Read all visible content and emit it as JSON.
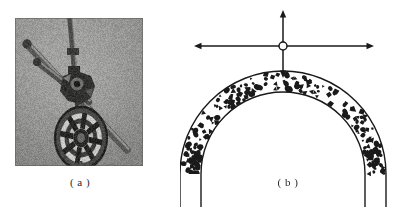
{
  "figure": {
    "background_color": "#ffffff",
    "ink_color": "#1a1a1a",
    "width": 418,
    "height": 211,
    "panels": [
      {
        "id": "a",
        "caption": "( a )",
        "type": "photograph",
        "subject": "mechanical drilling rig head assembly",
        "photo": {
          "frame": {
            "x": 15,
            "y": 18,
            "width": 128,
            "height": 148
          },
          "background_gray": "#a9a9a7",
          "vignette_gray": "#8f8f8d",
          "parts": [
            {
              "name": "vertical-drill-shaft",
              "shade": "#4a4a48"
            },
            {
              "name": "upper-diagonal-rod",
              "shade": "#565654"
            },
            {
              "name": "lower-diagonal-rod",
              "shade": "#5e5e5c"
            },
            {
              "name": "central-hub-joint",
              "shade": "#2e2e2c"
            },
            {
              "name": "rosette-cutter-head",
              "shade": "#3a3a38"
            },
            {
              "name": "cutter-hub-core",
              "shade": "#262624"
            }
          ]
        }
      },
      {
        "id": "b",
        "caption": "( b )",
        "type": "line-diagram",
        "subject": "arch cross-section with granular stipple fill and four-way force arrows at crown",
        "arch": {
          "center_x": 103,
          "center_y": 174,
          "outer_radius": 103,
          "inner_radius": 82,
          "stroke_width": 1.4,
          "fill_pattern": "stipple",
          "stipple_count": 170
        },
        "crown_marker": {
          "name": "crown-node",
          "x": 103,
          "y": 46,
          "radius": 4,
          "fill": "#ffffff"
        },
        "arrows": [
          {
            "name": "arrow-up",
            "direction": "up",
            "from_x": 103,
            "from_y": 46,
            "to_x": 103,
            "to_y": 10
          },
          {
            "name": "arrow-down",
            "direction": "down",
            "from_x": 103,
            "from_y": 46,
            "to_x": 103,
            "to_y": 78
          },
          {
            "name": "arrow-left",
            "direction": "left",
            "from_x": 103,
            "from_y": 46,
            "to_x": 14,
            "to_y": 46
          },
          {
            "name": "arrow-right",
            "direction": "right",
            "from_x": 103,
            "from_y": 46,
            "to_x": 194,
            "to_y": 46
          }
        ]
      }
    ]
  }
}
